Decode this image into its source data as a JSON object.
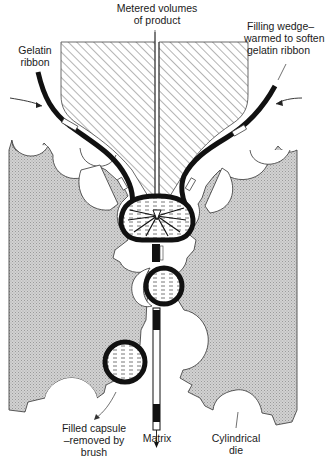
{
  "diagram": {
    "type": "rotary-die softgel encapsulation process",
    "colors": {
      "die_fill": "#c9c9c9",
      "wedge_hatch": "#555555",
      "ribbon": "#111111",
      "fill_dashes": "#444444",
      "background": "#ffffff"
    },
    "labels": {
      "metered_line1": "Metered volumes",
      "metered_line2": "of product",
      "gelatin_line1": "Gelatin",
      "gelatin_line2": "ribbon",
      "wedge_line1": "Filling wedge–",
      "wedge_line2": "warmed to soften",
      "wedge_line3": "gelatin ribbon",
      "filled_line1": "Filled capsule",
      "filled_line2": "–removed by",
      "filled_line3": "brush",
      "matrix": "Matrix",
      "die_line1": "Cylindrical",
      "die_line2": "die"
    },
    "components": [
      {
        "name": "filling-wedge",
        "description": "Hatched wedge with central product channel"
      },
      {
        "name": "left-gelatin-ribbon",
        "description": "Thick black ribbon fed from upper left"
      },
      {
        "name": "right-gelatin-ribbon",
        "description": "Thick black ribbon fed from upper right"
      },
      {
        "name": "left-cylindrical-die",
        "description": "Grey stippled die with capsule pockets, rotates clockwise"
      },
      {
        "name": "right-cylindrical-die",
        "description": "Grey stippled die with capsule pockets, rotates anticlockwise"
      },
      {
        "name": "capsule-being-filled",
        "description": "Capsule at wedge tip receiving product"
      },
      {
        "name": "sealed-capsule",
        "description": "Capsule sealed between dies"
      },
      {
        "name": "ejected-capsule",
        "description": "Filled capsule removed by brush"
      },
      {
        "name": "matrix-strip",
        "description": "Spent gelatin web exiting downward"
      }
    ]
  }
}
